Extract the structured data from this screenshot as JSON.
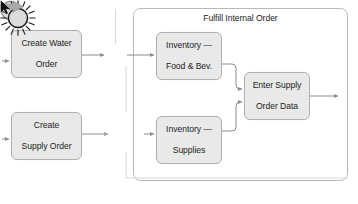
{
  "diagram": {
    "type": "process-flow",
    "pool": {
      "title": "Fulfill Internal Order"
    },
    "tasks": [
      {
        "id": "create-water-order",
        "line1": "Create Water",
        "line2": "Order"
      },
      {
        "id": "create-supply-order",
        "line1": "Create",
        "line2": "Supply Order"
      },
      {
        "id": "inventory-food-bev",
        "line1": "Inventory —",
        "line2": "Food & Bev."
      },
      {
        "id": "inventory-supplies",
        "line1": "Inventory —",
        "line2": "Supplies"
      },
      {
        "id": "enter-supply-order-data",
        "line1": "Enter Supply",
        "line2": "Order Data"
      }
    ],
    "events": [
      {
        "id": "intermediate-event",
        "shape": "circle",
        "label": ""
      },
      {
        "id": "signal-event",
        "shape": "starburst",
        "label": ""
      }
    ],
    "pointer": {
      "cursor": "arrow-cursor",
      "drag_hint": "drag-arrow"
    },
    "colors": {
      "task_fill": "#e9e9e9",
      "task_border": "#b0b0b0",
      "event_fill": "#dcdcdc",
      "event_border": "#707070",
      "signal_border": "#1a1a1a",
      "connector": "#808080",
      "pool_border": "#b8b8b8",
      "text": "#1d1d1d",
      "drag_arrow": "#a8a8a8"
    },
    "bottom_caption": ""
  }
}
